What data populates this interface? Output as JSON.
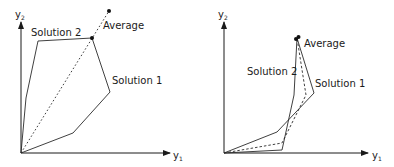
{
  "diagrams": [
    {
      "id": "left",
      "axes": {
        "x_label": "y",
        "x_sub": "1",
        "y_label": "y",
        "y_sub": "2"
      },
      "labels": {
        "solution_2": "Solution 2",
        "solution_1": "Solution 1",
        "average": "Average"
      },
      "geometry": {
        "origin": [
          21,
          153
        ],
        "y_axis_top": [
          21,
          27
        ],
        "x_axis_end": [
          165,
          153
        ],
        "solution_2_points": "21,153 26,98 38,41 92,38",
        "solution_1_points": "92,38 110,92 73,133 21,153",
        "average_line": "21,153 109,11",
        "dots": [
          [
            92,
            38
          ],
          [
            109,
            11
          ]
        ]
      }
    },
    {
      "id": "right",
      "axes": {
        "x_label": "y",
        "x_sub": "1",
        "y_label": "y",
        "y_sub": "2"
      },
      "labels": {
        "solution_2": "Solution 2",
        "solution_1": "Solution 1",
        "average": "Average"
      },
      "geometry": {
        "origin": [
          224,
          153
        ],
        "y_axis_top": [
          224,
          27
        ],
        "x_axis_end": [
          365,
          153
        ],
        "solution_2_points": "224,153 282,150 294,95 297,38",
        "solution_1_points": "297,38 314,93 277,132 224,153",
        "average_line": "224,153 282,143 306,95 297,38",
        "dots": [
          [
            296,
            39
          ],
          [
            298,
            37
          ]
        ]
      }
    }
  ]
}
